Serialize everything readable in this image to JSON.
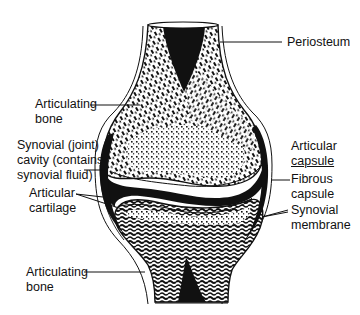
{
  "diagram": {
    "colors": {
      "ink": "#111111",
      "background": "#ffffff"
    },
    "labels": {
      "periosteum": {
        "lines": [
          "Periosteum"
        ]
      },
      "articulating_bone_upper": {
        "lines": [
          "Articulating",
          "bone"
        ]
      },
      "synovial_cavity": {
        "lines": [
          "Synovial (joint)",
          "cavity (contains",
          "synovial fluid)"
        ]
      },
      "articular_cartilage": {
        "lines": [
          "Articular",
          "cartilage"
        ]
      },
      "articulating_bone_lower": {
        "lines": [
          "Articulating",
          "bone"
        ]
      },
      "articular_capsule": {
        "lines": [
          "Articular",
          "capsule"
        ]
      },
      "fibrous_capsule": {
        "lines": [
          "Fibrous",
          "capsule"
        ]
      },
      "synovial_membrane": {
        "lines": [
          "Synovial",
          "membrane"
        ]
      }
    }
  }
}
